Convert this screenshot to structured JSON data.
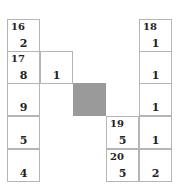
{
  "puzzle": {
    "cell_size": 33,
    "cells": [
      {
        "id": "r0c0",
        "x": 7,
        "y": 19,
        "clue": "16",
        "value": "2"
      },
      {
        "id": "r1c0",
        "x": 7,
        "y": 51,
        "clue": "17",
        "value": "8"
      },
      {
        "id": "r1c1",
        "x": 40,
        "y": 51,
        "clue": "",
        "value": "1"
      },
      {
        "id": "r2c0",
        "x": 7,
        "y": 83,
        "clue": "",
        "value": "9"
      },
      {
        "id": "r3c0",
        "x": 7,
        "y": 116,
        "clue": "",
        "value": "5"
      },
      {
        "id": "r4c0",
        "x": 7,
        "y": 149,
        "clue": "",
        "value": "4"
      },
      {
        "id": "r2c2",
        "x": 73,
        "y": 83,
        "clue": "",
        "value": "",
        "block": true
      },
      {
        "id": "r3c3",
        "x": 106,
        "y": 116,
        "clue": "19",
        "value": "5"
      },
      {
        "id": "r4c3",
        "x": 106,
        "y": 149,
        "clue": "20",
        "value": "5"
      },
      {
        "id": "r0c4",
        "x": 139,
        "y": 19,
        "clue": "18",
        "value": "1"
      },
      {
        "id": "r1c4",
        "x": 139,
        "y": 51,
        "clue": "",
        "value": "1"
      },
      {
        "id": "r2c4",
        "x": 139,
        "y": 83,
        "clue": "",
        "value": "1"
      },
      {
        "id": "r3c4",
        "x": 139,
        "y": 116,
        "clue": "",
        "value": "1"
      },
      {
        "id": "r4c4",
        "x": 139,
        "y": 149,
        "clue": "",
        "value": "2"
      }
    ],
    "colors": {
      "grid_line": "#b5b5b5",
      "block": "#9a9a9a",
      "text": "#222222"
    }
  }
}
